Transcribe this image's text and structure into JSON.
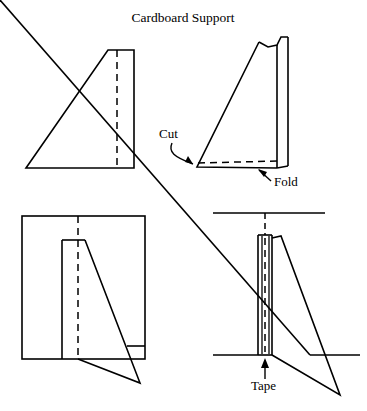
{
  "page": {
    "background_color": "#ffffff",
    "ink_color": "#000000",
    "width": 367,
    "height": 411
  },
  "title": {
    "text": "Cardboard Support",
    "x": 183,
    "y": 22
  },
  "labels": {
    "cut": "Cut",
    "fold": "Fold",
    "tape": "Tape"
  },
  "figures": [
    {
      "id": "flat-blank",
      "name": "flat-cardboard-blank",
      "description": "Flat rectangle of cardboard with diagonal cut line and dashed fold line",
      "outline_points": "26,168 108,50 134,50 134,168",
      "fold_line": {
        "x1": 117,
        "y1": 50,
        "x2": 117,
        "y2": 168,
        "style": "dashed"
      }
    },
    {
      "id": "folded-support",
      "name": "folded-cardboard-support",
      "description": "Cardboard folded along the dashed line forming an L-shaped right-triangle support",
      "cut_line": {
        "x1": 198,
        "y1": 163,
        "x2": 281,
        "y2": 161,
        "style": "dashed"
      },
      "fold_edge_x": 277
    },
    {
      "id": "support-front-view",
      "name": "support-attached-front-view",
      "description": "Support taped to the back of an upright board, seen from the front",
      "board_rect": {
        "x": 22,
        "y": 216,
        "width": 123,
        "height": 143
      },
      "fold_line": {
        "x1": 78,
        "y1": 216,
        "x2": 78,
        "y2": 359,
        "style": "dashed"
      }
    },
    {
      "id": "support-edge-view",
      "name": "support-attached-edge-view",
      "description": "Edge-on view of board standing on a shelf with the support taped behind it",
      "shelf_top_line": {
        "x1": 213,
        "y1": 213,
        "x2": 325,
        "y2": 213
      },
      "shelf_bottom_left": {
        "x1": 213,
        "y1": 355,
        "x2": 258,
        "y2": 355
      },
      "shelf_bottom_right": {
        "x1": 310,
        "y1": 355,
        "x2": 360,
        "y2": 355
      },
      "tape_line": {
        "x1": 265,
        "y1": 235,
        "x2": 265,
        "y2": 353,
        "style": "dashed"
      }
    }
  ],
  "annotations": [
    {
      "name": "cut-callout",
      "text": "Cut",
      "text_x": 178,
      "text_y": 134,
      "arrow": "curved-down-right",
      "target_x": 199,
      "target_y": 160
    },
    {
      "name": "fold-callout",
      "text": "Fold",
      "text_x": 272,
      "text_y": 184,
      "arrow": "straight-up-left",
      "target_x": 262,
      "target_y": 168
    },
    {
      "name": "tape-callout",
      "text": "Tape",
      "text_x": 251,
      "text_y": 384,
      "arrow": "straight-up",
      "target_x": 265,
      "target_y": 357
    }
  ]
}
